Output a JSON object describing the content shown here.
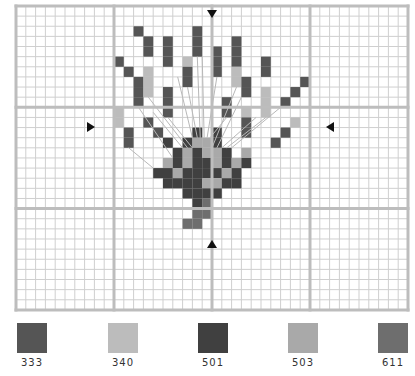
{
  "pattern": {
    "grid": {
      "columns": 40,
      "rows": 30,
      "origin_x": 16,
      "origin_y": 6,
      "cell_w": 9.8,
      "cell_h": 10.13,
      "major_every": 10,
      "minor_color": "#cfcfcf",
      "major_color": "#bdbdbd",
      "center_col": 20,
      "center_row": 12
    },
    "markers": [
      {
        "name": "top-center-arrow",
        "dir": "down",
        "x": 212,
        "y": 14
      },
      {
        "name": "bottom-center-arrow",
        "dir": "up",
        "x": 212,
        "y": 244
      },
      {
        "name": "left-center-arrow",
        "dir": "right",
        "x": 91,
        "y": 127
      },
      {
        "name": "right-center-arrow",
        "dir": "left",
        "x": 330,
        "y": 127
      }
    ],
    "stitches": [
      {
        "c": 12,
        "r": 2,
        "k": "333"
      },
      {
        "c": 13,
        "r": 3,
        "k": "333"
      },
      {
        "c": 13,
        "r": 4,
        "k": "333"
      },
      {
        "c": 10,
        "r": 5,
        "k": "333"
      },
      {
        "c": 11,
        "r": 6,
        "k": "333"
      },
      {
        "c": 12,
        "r": 7,
        "k": "333"
      },
      {
        "c": 12,
        "r": 8,
        "k": "333"
      },
      {
        "c": 12,
        "r": 9,
        "k": "333"
      },
      {
        "c": 13,
        "r": 6,
        "k": "340"
      },
      {
        "c": 13,
        "r": 7,
        "k": "340"
      },
      {
        "c": 13,
        "r": 8,
        "k": "340"
      },
      {
        "c": 15,
        "r": 3,
        "k": "333"
      },
      {
        "c": 15,
        "r": 4,
        "k": "333"
      },
      {
        "c": 15,
        "r": 5,
        "k": "333"
      },
      {
        "c": 15,
        "r": 8,
        "k": "333"
      },
      {
        "c": 15,
        "r": 9,
        "k": "333"
      },
      {
        "c": 15,
        "r": 10,
        "k": "333"
      },
      {
        "c": 17,
        "r": 5,
        "k": "340"
      },
      {
        "c": 17,
        "r": 6,
        "k": "333"
      },
      {
        "c": 17,
        "r": 7,
        "k": "333"
      },
      {
        "c": 18,
        "r": 2,
        "k": "333"
      },
      {
        "c": 18,
        "r": 3,
        "k": "333"
      },
      {
        "c": 18,
        "r": 4,
        "k": "333"
      },
      {
        "c": 20,
        "r": 4,
        "k": "333"
      },
      {
        "c": 20,
        "r": 5,
        "k": "333"
      },
      {
        "c": 20,
        "r": 6,
        "k": "333"
      },
      {
        "c": 22,
        "r": 3,
        "k": "333"
      },
      {
        "c": 22,
        "r": 4,
        "k": "333"
      },
      {
        "c": 22,
        "r": 5,
        "k": "333"
      },
      {
        "c": 22,
        "r": 6,
        "k": "340"
      },
      {
        "c": 22,
        "r": 7,
        "k": "340"
      },
      {
        "c": 23,
        "r": 7,
        "k": "333"
      },
      {
        "c": 23,
        "r": 8,
        "k": "333"
      },
      {
        "c": 23,
        "r": 10,
        "k": "340"
      },
      {
        "c": 23,
        "r": 11,
        "k": "333"
      },
      {
        "c": 23,
        "r": 12,
        "k": "333"
      },
      {
        "c": 25,
        "r": 5,
        "k": "333"
      },
      {
        "c": 25,
        "r": 6,
        "k": "333"
      },
      {
        "c": 25,
        "r": 8,
        "k": "340"
      },
      {
        "c": 25,
        "r": 9,
        "k": "340"
      },
      {
        "c": 25,
        "r": 10,
        "k": "340"
      },
      {
        "c": 29,
        "r": 7,
        "k": "333"
      },
      {
        "c": 28,
        "r": 8,
        "k": "333"
      },
      {
        "c": 27,
        "r": 9,
        "k": "333"
      },
      {
        "c": 21,
        "r": 9,
        "k": "333"
      },
      {
        "c": 21,
        "r": 10,
        "k": "333"
      },
      {
        "c": 10,
        "r": 10,
        "k": "340"
      },
      {
        "c": 10,
        "r": 11,
        "k": "340"
      },
      {
        "c": 13,
        "r": 11,
        "k": "333"
      },
      {
        "c": 11,
        "r": 12,
        "k": "333"
      },
      {
        "c": 11,
        "r": 13,
        "k": "333"
      },
      {
        "c": 14,
        "r": 12,
        "k": "333"
      },
      {
        "c": 28,
        "r": 11,
        "k": "340"
      },
      {
        "c": 27,
        "r": 12,
        "k": "333"
      },
      {
        "c": 26,
        "r": 13,
        "k": "333"
      },
      {
        "c": 18,
        "r": 12,
        "k": "501"
      },
      {
        "c": 20,
        "r": 12,
        "k": "501"
      },
      {
        "c": 15,
        "r": 13,
        "k": "501"
      },
      {
        "c": 17,
        "r": 13,
        "k": "501"
      },
      {
        "c": 18,
        "r": 13,
        "k": "503"
      },
      {
        "c": 19,
        "r": 13,
        "k": "503"
      },
      {
        "c": 20,
        "r": 13,
        "k": "501"
      },
      {
        "c": 16,
        "r": 14,
        "k": "501"
      },
      {
        "c": 17,
        "r": 14,
        "k": "503"
      },
      {
        "c": 18,
        "r": 14,
        "k": "501"
      },
      {
        "c": 19,
        "r": 14,
        "k": "503"
      },
      {
        "c": 20,
        "r": 14,
        "k": "503"
      },
      {
        "c": 21,
        "r": 14,
        "k": "501"
      },
      {
        "c": 23,
        "r": 14,
        "k": "503"
      },
      {
        "c": 15,
        "r": 15,
        "k": "503"
      },
      {
        "c": 16,
        "r": 15,
        "k": "501"
      },
      {
        "c": 17,
        "r": 15,
        "k": "503"
      },
      {
        "c": 18,
        "r": 15,
        "k": "501"
      },
      {
        "c": 19,
        "r": 15,
        "k": "501"
      },
      {
        "c": 20,
        "r": 15,
        "k": "503"
      },
      {
        "c": 21,
        "r": 15,
        "k": "501"
      },
      {
        "c": 22,
        "r": 15,
        "k": "503"
      },
      {
        "c": 23,
        "r": 15,
        "k": "501"
      },
      {
        "c": 14,
        "r": 16,
        "k": "501"
      },
      {
        "c": 15,
        "r": 16,
        "k": "501"
      },
      {
        "c": 16,
        "r": 16,
        "k": "503"
      },
      {
        "c": 17,
        "r": 16,
        "k": "501"
      },
      {
        "c": 18,
        "r": 16,
        "k": "501"
      },
      {
        "c": 19,
        "r": 16,
        "k": "501"
      },
      {
        "c": 20,
        "r": 16,
        "k": "501"
      },
      {
        "c": 21,
        "r": 16,
        "k": "503"
      },
      {
        "c": 22,
        "r": 16,
        "k": "501"
      },
      {
        "c": 15,
        "r": 17,
        "k": "501"
      },
      {
        "c": 16,
        "r": 17,
        "k": "501"
      },
      {
        "c": 17,
        "r": 17,
        "k": "501"
      },
      {
        "c": 18,
        "r": 17,
        "k": "501"
      },
      {
        "c": 19,
        "r": 17,
        "k": "503"
      },
      {
        "c": 20,
        "r": 17,
        "k": "503"
      },
      {
        "c": 21,
        "r": 17,
        "k": "501"
      },
      {
        "c": 22,
        "r": 17,
        "k": "501"
      },
      {
        "c": 17,
        "r": 18,
        "k": "501"
      },
      {
        "c": 18,
        "r": 18,
        "k": "501"
      },
      {
        "c": 19,
        "r": 18,
        "k": "501"
      },
      {
        "c": 20,
        "r": 18,
        "k": "501"
      },
      {
        "c": 18,
        "r": 19,
        "k": "501"
      },
      {
        "c": 19,
        "r": 19,
        "k": "611"
      },
      {
        "c": 18,
        "r": 20,
        "k": "611"
      },
      {
        "c": 19,
        "r": 20,
        "k": "611"
      },
      {
        "c": 17,
        "r": 21,
        "k": "611"
      },
      {
        "c": 18,
        "r": 21,
        "k": "611"
      }
    ],
    "backstitch_color": "#b8b8b8",
    "backstitches": [
      [
        13.5,
        9,
        17.5,
        14
      ],
      [
        12.5,
        10,
        16,
        15
      ],
      [
        14,
        10.5,
        17,
        14
      ],
      [
        15.5,
        11,
        18,
        14
      ],
      [
        16.5,
        7,
        18,
        13
      ],
      [
        17.5,
        8,
        18.5,
        13
      ],
      [
        18.5,
        5,
        18.8,
        13
      ],
      [
        19,
        5,
        19.2,
        13
      ],
      [
        20.5,
        7,
        19.5,
        13
      ],
      [
        21.5,
        11,
        19.8,
        13
      ],
      [
        22.5,
        8,
        20,
        14
      ],
      [
        23,
        9,
        20.5,
        14
      ],
      [
        24.5,
        11,
        21,
        14
      ],
      [
        25.5,
        11,
        21.5,
        14
      ],
      [
        27,
        10,
        22,
        14
      ],
      [
        11.5,
        14,
        14,
        16
      ]
    ]
  },
  "legend": {
    "items": [
      {
        "code": "333",
        "color": "#555555",
        "x": 17
      },
      {
        "code": "340",
        "color": "#bcbcbc",
        "x": 108
      },
      {
        "code": "501",
        "color": "#404040",
        "x": 198
      },
      {
        "code": "503",
        "color": "#a9a9a9",
        "x": 288
      },
      {
        "code": "611",
        "color": "#6e6e6e",
        "x": 378
      }
    ]
  }
}
